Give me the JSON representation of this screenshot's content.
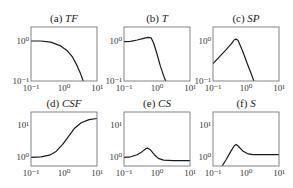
{
  "figure": {
    "layout": {
      "rows": 2,
      "cols": 3,
      "col_x": [
        31,
        124,
        213
      ],
      "row_y": [
        27,
        112
      ],
      "panel_w": 66,
      "panel_h": 54
    },
    "colors": {
      "curve": "#1a1a1a",
      "frame": "#777777",
      "text": "#222222"
    }
  },
  "chart_data": [
    {
      "id": "a",
      "title_prefix": "(a) ",
      "title_italic": "TF",
      "type": "line",
      "xscale": "log",
      "yscale": "log",
      "xlim": [
        0.1,
        10
      ],
      "ylim": [
        0.1,
        1.4
      ],
      "xticks": [
        "10⁻¹",
        "10⁰",
        "10¹"
      ],
      "yticks": [
        {
          "label": "10⁰",
          "frac": 0.26
        },
        {
          "label": "10⁻¹",
          "frac": 1.0
        }
      ],
      "description": "Flat at ~1 then rolls off steeply, reaching 0.1 near x≈3",
      "points": [
        [
          0,
          0.26
        ],
        [
          0.15,
          0.26
        ],
        [
          0.3,
          0.28
        ],
        [
          0.45,
          0.35
        ],
        [
          0.55,
          0.44
        ],
        [
          0.63,
          0.56
        ],
        [
          0.7,
          0.72
        ],
        [
          0.75,
          0.86
        ],
        [
          0.79,
          1.0
        ]
      ]
    },
    {
      "id": "b",
      "title_prefix": "(b) ",
      "title_italic": "T",
      "type": "line",
      "xscale": "log",
      "yscale": "log",
      "xlim": [
        0.1,
        10
      ],
      "ylim": [
        0.1,
        1.4
      ],
      "xticks": [
        "10⁻¹",
        "10⁰",
        "10¹"
      ],
      "yticks": [
        {
          "label": "10⁰",
          "frac": 0.26
        },
        {
          "label": "10⁻¹",
          "frac": 1.0
        }
      ],
      "description": "Slight rise to a peak ~1.2 near x≈0.45, then steep linear drop to 0.1 near x≈1.3",
      "points": [
        [
          0,
          0.27
        ],
        [
          0.1,
          0.265
        ],
        [
          0.2,
          0.24
        ],
        [
          0.3,
          0.21
        ],
        [
          0.36,
          0.19
        ],
        [
          0.41,
          0.2
        ],
        [
          0.45,
          0.3
        ],
        [
          0.5,
          0.5
        ],
        [
          0.55,
          0.72
        ],
        [
          0.6,
          0.9
        ],
        [
          0.63,
          1.0
        ]
      ]
    },
    {
      "id": "c",
      "title_prefix": "(c) ",
      "title_italic": "SP",
      "type": "line",
      "xscale": "log",
      "yscale": "log",
      "xlim": [
        0.1,
        10
      ],
      "ylim": [
        0.1,
        1.4
      ],
      "xticks": [
        "10⁻¹",
        "10⁰",
        "10¹"
      ],
      "yticks": [
        {
          "label": "10⁰",
          "frac": 0.26
        },
        {
          "label": "10⁻¹",
          "frac": 1.0
        }
      ],
      "description": "Linear rise from ~0.25 at x=0.1 to peak ~1.2 near x≈0.45, then steep fall to 0.1 near x≈1.4",
      "points": [
        [
          0,
          0.68
        ],
        [
          0.1,
          0.55
        ],
        [
          0.2,
          0.42
        ],
        [
          0.28,
          0.31
        ],
        [
          0.32,
          0.24
        ],
        [
          0.35,
          0.225
        ],
        [
          0.38,
          0.25
        ],
        [
          0.45,
          0.45
        ],
        [
          0.52,
          0.68
        ],
        [
          0.58,
          0.87
        ],
        [
          0.62,
          1.0
        ]
      ]
    },
    {
      "id": "d",
      "title_prefix": "(d) ",
      "title_italic": "CSF",
      "type": "line",
      "xscale": "log",
      "yscale": "log",
      "xlim": [
        0.1,
        10
      ],
      "ylim": [
        0.8,
        20
      ],
      "xticks": [
        "10⁻¹",
        "10⁰",
        "10¹"
      ],
      "yticks": [
        {
          "label": "10¹",
          "frac": 0.24
        },
        {
          "label": "10⁰",
          "frac": 0.84
        }
      ],
      "description": "Sigmoid increase from ~1 at x=0.1 to ~15 at x=10",
      "points": [
        [
          0,
          0.84
        ],
        [
          0.15,
          0.83
        ],
        [
          0.28,
          0.8
        ],
        [
          0.38,
          0.73
        ],
        [
          0.48,
          0.6
        ],
        [
          0.57,
          0.45
        ],
        [
          0.66,
          0.3
        ],
        [
          0.76,
          0.2
        ],
        [
          0.88,
          0.14
        ],
        [
          1.0,
          0.12
        ]
      ]
    },
    {
      "id": "e",
      "title_prefix": "(e) ",
      "title_italic": "CS",
      "type": "line",
      "xscale": "log",
      "yscale": "log",
      "xlim": [
        0.1,
        10
      ],
      "ylim": [
        0.8,
        20
      ],
      "xticks": [
        "10⁻¹",
        "10⁰",
        "10¹"
      ],
      "yticks": [
        {
          "label": "10¹",
          "frac": 0.24
        },
        {
          "label": "10⁰",
          "frac": 0.84
        }
      ],
      "description": "~1 at low x, bump to ~1.8 near x≈0.45, settles to ~0.85 for high x",
      "points": [
        [
          0,
          0.84
        ],
        [
          0.1,
          0.83
        ],
        [
          0.2,
          0.79
        ],
        [
          0.28,
          0.73
        ],
        [
          0.33,
          0.68
        ],
        [
          0.36,
          0.67
        ],
        [
          0.4,
          0.7
        ],
        [
          0.46,
          0.79
        ],
        [
          0.52,
          0.86
        ],
        [
          0.6,
          0.89
        ],
        [
          0.75,
          0.9
        ],
        [
          1.0,
          0.9
        ]
      ]
    },
    {
      "id": "f",
      "title_prefix": "(f) ",
      "title_italic": "S",
      "type": "line",
      "xscale": "log",
      "yscale": "log",
      "xlim": [
        0.1,
        10
      ],
      "ylim": [
        0.8,
        20
      ],
      "xticks": [
        "10⁻¹",
        "10⁰",
        "10¹"
      ],
      "yticks": [
        {
          "label": "10¹",
          "frac": 0.24
        },
        {
          "label": "10⁰",
          "frac": 0.84
        }
      ],
      "description": "Starts below axis near x≈0.15, rises to peak ~2.5 near x≈0.45, then falls and plateaus at ~1",
      "points": [
        [
          0.14,
          1.0
        ],
        [
          0.2,
          0.88
        ],
        [
          0.27,
          0.73
        ],
        [
          0.32,
          0.63
        ],
        [
          0.35,
          0.6
        ],
        [
          0.38,
          0.63
        ],
        [
          0.45,
          0.72
        ],
        [
          0.52,
          0.77
        ],
        [
          0.6,
          0.79
        ],
        [
          0.75,
          0.79
        ],
        [
          1.0,
          0.79
        ]
      ]
    }
  ]
}
